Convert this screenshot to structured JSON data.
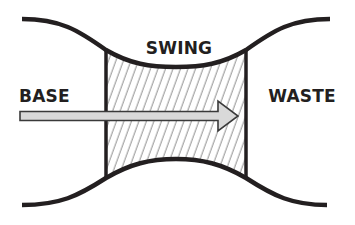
{
  "diagram": {
    "labels": {
      "swing": "SWING",
      "base": "BASE",
      "waste": "WASTE"
    },
    "colors": {
      "stroke": "#231f20",
      "hatch": "#8a8a8a",
      "arrow_fill": "#d9d9d9",
      "arrow_stroke": "#3a3a3a",
      "background": "#ffffff"
    },
    "shapes": {
      "top_curve": "waist-shaped curve dipping toward center",
      "bottom_curve": "mirror of top curve rising toward center",
      "hatched_region": "swing zone between two vertical lines",
      "arrow": "arrow pointing right from BASE toward WASTE"
    }
  }
}
